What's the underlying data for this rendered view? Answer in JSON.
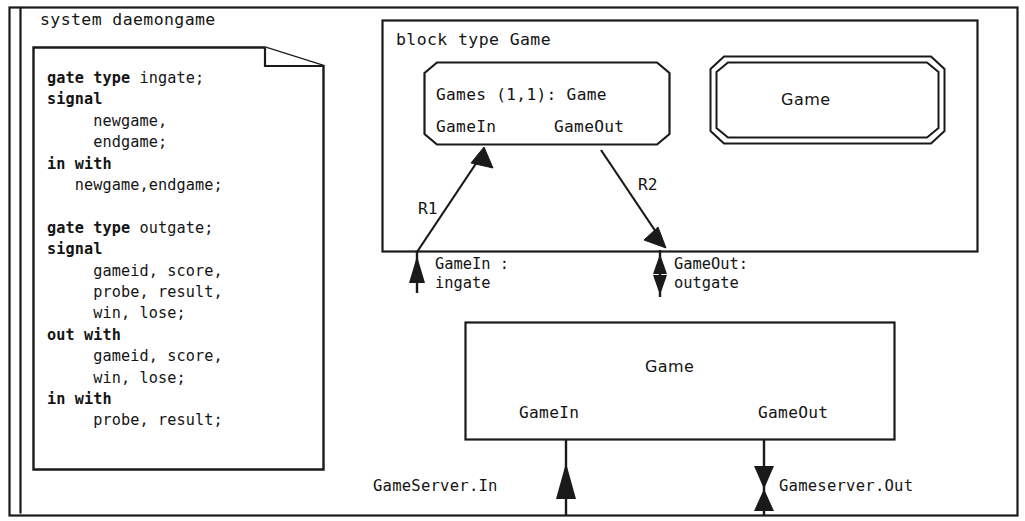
{
  "diagram": {
    "kind": "SDL-2000 system / block structure diagram",
    "stroke_color": "#1a1a1a",
    "background": "#ffffff"
  },
  "system": {
    "title": "system daemongame",
    "document": {
      "lines": [
        {
          "bold": "gate type",
          "rest": " ingate;"
        },
        {
          "bold": "signal",
          "rest": ""
        },
        {
          "bold": "",
          "rest": "     newgame,"
        },
        {
          "bold": "",
          "rest": "     endgame;"
        },
        {
          "bold": "in with",
          "rest": ""
        },
        {
          "bold": "",
          "rest": "   newgame,endgame;"
        },
        {
          "blank": true
        },
        {
          "bold": "gate type",
          "rest": " outgate;"
        },
        {
          "bold": "signal",
          "rest": ""
        },
        {
          "bold": "",
          "rest": "     gameid, score,"
        },
        {
          "bold": "",
          "rest": "     probe, result,"
        },
        {
          "bold": "",
          "rest": "     win, lose;"
        },
        {
          "bold": "out with",
          "rest": ""
        },
        {
          "bold": "",
          "rest": "     gameid, score,"
        },
        {
          "bold": "",
          "rest": "     win, lose;"
        },
        {
          "bold": "in with",
          "rest": ""
        },
        {
          "bold": "",
          "rest": "     probe, result;"
        }
      ]
    }
  },
  "block": {
    "title": "block type Game",
    "instance": {
      "header": "Games (1,1): Game",
      "gate_in": "GameIn",
      "gate_out": "GameOut"
    },
    "octagon": {
      "label": "Game"
    },
    "relations": {
      "r1": "R1",
      "r2": "R2"
    },
    "gates": {
      "in": "GameIn :\ningate",
      "out": "GameOut:\noutgate"
    }
  },
  "server": {
    "title": "Game",
    "gate_in": "GameIn",
    "gate_out": "GameOut",
    "channels": {
      "in": "GameServer.In",
      "out": "Gameserver.Out"
    }
  },
  "icons": {
    "arrow_up": "arrow-up-icon",
    "arrow_down": "arrow-down-icon",
    "arrow_bidirectional": "bidirectional-arrow-icon",
    "folded_corner": "folded-page-corner-icon"
  }
}
